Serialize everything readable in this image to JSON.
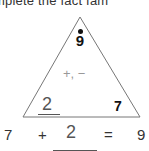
{
  "heading": "mplete the fact fam",
  "triangle": {
    "top_value": "9",
    "operations": "+, −",
    "left_value": "2",
    "right_value": "7"
  },
  "equation": {
    "operand1": "7",
    "operator": "+",
    "answer": "2",
    "equals": "=",
    "result": "9"
  }
}
